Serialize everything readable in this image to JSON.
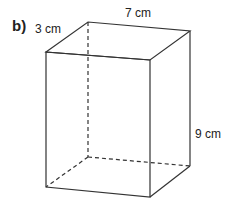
{
  "figure": {
    "part_label": "b)",
    "shape": "cuboid",
    "dimensions": {
      "depth": "3 cm",
      "width": "7 cm",
      "height": "9 cm"
    },
    "colors": {
      "line": "#333333",
      "text": "#222222"
    }
  }
}
